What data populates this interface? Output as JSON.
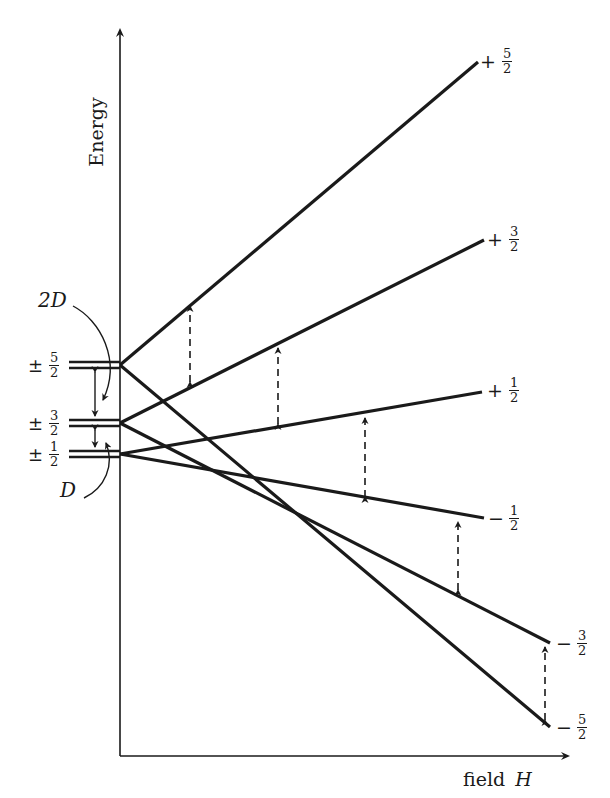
{
  "diagram": {
    "y_axis": {
      "label": "Energy"
    },
    "x_axis": {
      "label_prefix": "field",
      "label_var": "H"
    },
    "zero_field_labels": [
      {
        "sign": "±",
        "num": "5",
        "den": "2"
      },
      {
        "sign": "±",
        "num": "3",
        "den": "2"
      },
      {
        "sign": "±",
        "num": "1",
        "den": "2"
      }
    ],
    "splitting_labels": {
      "upper": "2D",
      "lower": "D"
    },
    "levels": [
      {
        "sign": "+",
        "num": "5",
        "den": "2"
      },
      {
        "sign": "+",
        "num": "3",
        "den": "2"
      },
      {
        "sign": "+",
        "num": "1",
        "den": "2"
      },
      {
        "sign": "−",
        "num": "1",
        "den": "2"
      },
      {
        "sign": "−",
        "num": "3",
        "den": "2"
      },
      {
        "sign": "−",
        "num": "5",
        "den": "2"
      }
    ],
    "colors": {
      "line": "#1a1a1a",
      "background": "#ffffff"
    }
  }
}
